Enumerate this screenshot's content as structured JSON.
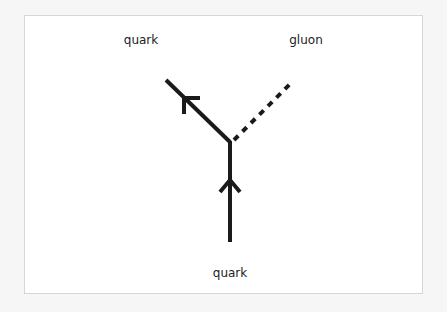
{
  "diagram": {
    "type": "feynman-vertex",
    "labels": {
      "incoming_quark": "quark",
      "outgoing_quark": "quark",
      "gluon": "gluon"
    },
    "particles": [
      {
        "name": "quark",
        "role": "incoming",
        "line_style": "solid",
        "arrow": "toward-vertex"
      },
      {
        "name": "quark",
        "role": "outgoing",
        "line_style": "solid",
        "arrow": "away-from-vertex"
      },
      {
        "name": "gluon",
        "role": "outgoing",
        "line_style": "dashed",
        "arrow": "none"
      }
    ],
    "colors": {
      "line": "#1a1a1a",
      "text": "#222222"
    }
  }
}
